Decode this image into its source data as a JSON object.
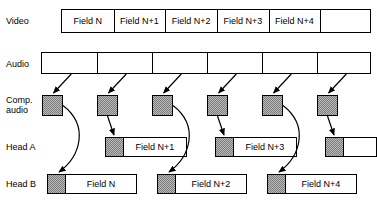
{
  "figure": {
    "colors": {
      "line": "#000000",
      "packet_fill": "#b9b9b9",
      "background": "#ffffff"
    }
  },
  "rows": [
    {
      "key": "video",
      "label": "Video"
    },
    {
      "key": "audio",
      "label": "Audio"
    },
    {
      "key": "comp_audio",
      "label": "Comp.\naudio"
    },
    {
      "key": "head_a",
      "label": "Head A"
    },
    {
      "key": "head_b",
      "label": "Head B"
    }
  ],
  "video_row": {
    "label": "Video",
    "segments": [
      {
        "caption": "Field N"
      },
      {
        "caption": "Field N+1"
      },
      {
        "caption": "Field N+2"
      },
      {
        "caption": "Field N+3"
      },
      {
        "caption": "Field N+4"
      },
      {
        "caption": ""
      }
    ]
  },
  "audio_row": {
    "label": "Audio",
    "segments": [
      {
        "caption": ""
      },
      {
        "caption": ""
      },
      {
        "caption": ""
      },
      {
        "caption": ""
      },
      {
        "caption": ""
      },
      {
        "caption": ""
      }
    ]
  },
  "comp_audio_row": {
    "label": "Comp.\naudio",
    "packets": [
      {
        "index": 1,
        "target": "head-b"
      },
      {
        "index": 2,
        "target": "head-a"
      },
      {
        "index": 3,
        "target": "head-b"
      },
      {
        "index": 4,
        "target": "head-a"
      },
      {
        "index": 5,
        "target": "head-b"
      },
      {
        "index": 6,
        "target": "head-a"
      }
    ]
  },
  "head_a_row": {
    "label": "Head A",
    "blocks": [
      {
        "caption": "Field N+1"
      },
      {
        "caption": "Field N+3"
      },
      {
        "caption": ""
      }
    ]
  },
  "head_b_row": {
    "label": "Head B",
    "blocks": [
      {
        "caption": "Field N"
      },
      {
        "caption": "Field N+2"
      },
      {
        "caption": "Field N+4"
      }
    ]
  }
}
